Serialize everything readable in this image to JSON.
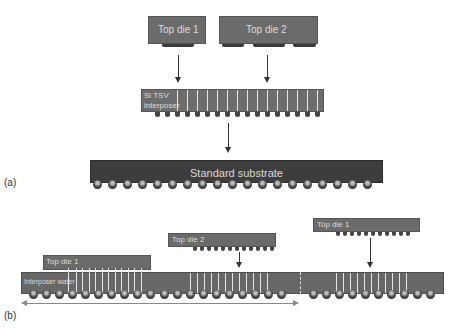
{
  "panel_a": {
    "label": "(a)",
    "top_die_1": "Top die 1",
    "top_die_2": "Top die 2",
    "interposer_line1": "Si TSV",
    "interposer_line2": "interposer",
    "substrate": "Standard substrate"
  },
  "panel_b": {
    "label": "(b)",
    "placed_die": "Top die 1",
    "incoming_die_2": "Top die 2",
    "incoming_die_1": "Top die 1",
    "wafer": "Interposer wafer"
  },
  "colors": {
    "die": "#6b6b6b",
    "interposer": "#6d6d6d",
    "substrate": "#3d3d3d",
    "arrow": "#333333",
    "text_light": "#dcdcdc"
  }
}
